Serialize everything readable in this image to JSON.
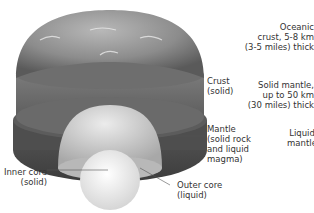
{
  "diagram": {
    "labels": {
      "crust": {
        "line1": "Crust",
        "line2": "(solid)"
      },
      "mantle": {
        "line1": "Mantle",
        "line2": "(solid rock",
        "line3": "and liquid",
        "line4": "magma)"
      },
      "inner_core": {
        "line1": "Inner core",
        "line2": "(solid)"
      },
      "outer_core": {
        "line1": "Outer core",
        "line2": "(liquid)"
      },
      "oceanic_crust": {
        "line1": "Oceanic",
        "line2": "crust, 5-8 km",
        "line3": "(3-5 miles) thick"
      },
      "solid_mantle": {
        "line1": "Solid mantle,",
        "line2": "up to 50 km",
        "line3": "(30 miles) thick"
      },
      "liquid_mantle": {
        "line1": "Liquid",
        "line2": "mantle"
      }
    },
    "colors": {
      "crust": "#8a8a8a",
      "mantle_upper": "#6e6e6e",
      "mantle_lower": "#4a4a4a",
      "outer_core": "#cfcfcf",
      "inner_core": "#f2f2f2",
      "text": "#333333"
    }
  }
}
